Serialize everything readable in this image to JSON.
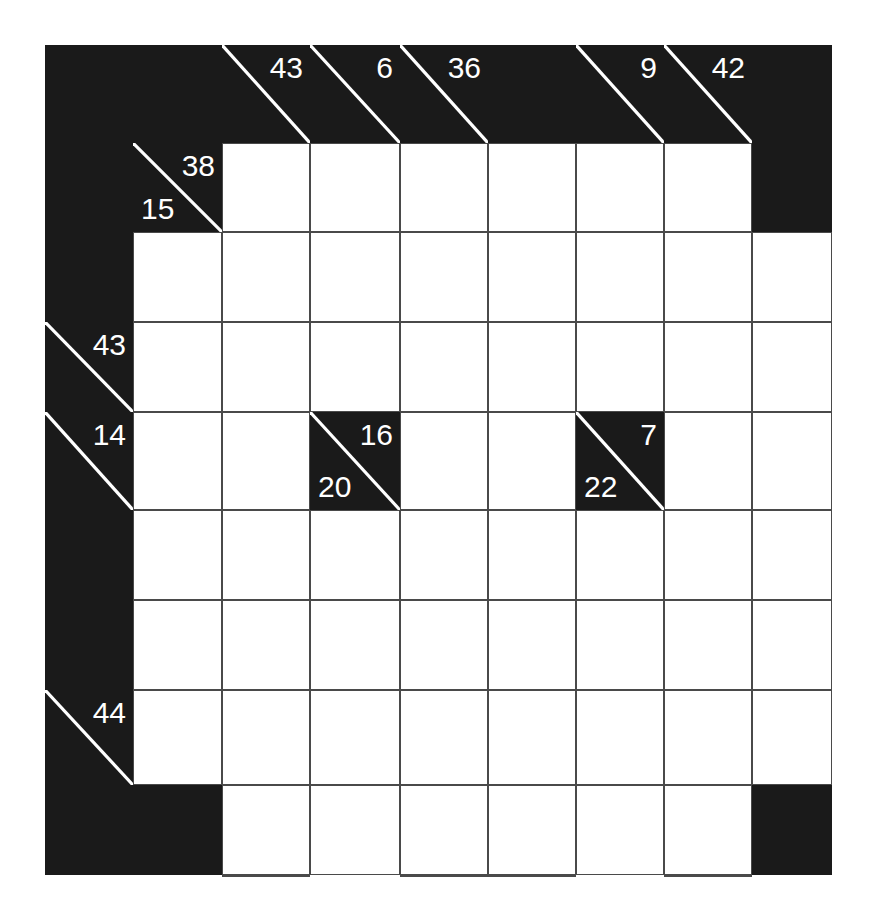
{
  "puzzle": {
    "type": "kakuro",
    "title": "Kakuro grid",
    "columns": 9,
    "rows": 9,
    "cell_width": 88,
    "cell_height": 92,
    "origin_x": 45,
    "origin_y": 45,
    "colors": {
      "block": "#1a1a1a",
      "cell": "#ffffff",
      "gridline": "#4a4a4a",
      "clue_text": "#ffffff",
      "page": "#ffffff"
    }
  },
  "cells": [
    {
      "name": "block-r0c0",
      "row": 0,
      "col": 0,
      "kind": "black"
    },
    {
      "name": "block-r0c1",
      "row": 0,
      "col": 1,
      "kind": "black"
    },
    {
      "name": "clue-r0c2",
      "row": 0,
      "col": 2,
      "kind": "clue",
      "down": "43",
      "across": ""
    },
    {
      "name": "clue-r0c3",
      "row": 0,
      "col": 3,
      "kind": "clue",
      "down": "6",
      "across": ""
    },
    {
      "name": "clue-r0c4",
      "row": 0,
      "col": 4,
      "kind": "clue",
      "down": "36",
      "across": ""
    },
    {
      "name": "block-r0c5",
      "row": 0,
      "col": 5,
      "kind": "black"
    },
    {
      "name": "clue-r0c6",
      "row": 0,
      "col": 6,
      "kind": "clue",
      "down": "9",
      "across": ""
    },
    {
      "name": "clue-r0c7",
      "row": 0,
      "col": 7,
      "kind": "clue",
      "down": "42",
      "across": ""
    },
    {
      "name": "block-r0c8",
      "row": 0,
      "col": 8,
      "kind": "black"
    },
    {
      "name": "block-r1c0",
      "row": 1,
      "col": 0,
      "kind": "black"
    },
    {
      "name": "clue-r1c1",
      "row": 1,
      "col": 1,
      "kind": "clue",
      "down": "38",
      "across": "15"
    },
    {
      "name": "cell-r1c2",
      "row": 1,
      "col": 2,
      "kind": "white"
    },
    {
      "name": "cell-r1c3",
      "row": 1,
      "col": 3,
      "kind": "white"
    },
    {
      "name": "cell-r1c4",
      "row": 1,
      "col": 4,
      "kind": "white"
    },
    {
      "name": "cell-r1c5",
      "row": 1,
      "col": 5,
      "kind": "white"
    },
    {
      "name": "cell-r1c6",
      "row": 1,
      "col": 6,
      "kind": "white"
    },
    {
      "name": "cell-r1c7",
      "row": 1,
      "col": 7,
      "kind": "white"
    },
    {
      "name": "block-r1c8",
      "row": 1,
      "col": 8,
      "kind": "black"
    },
    {
      "name": "block-r2c0",
      "row": 2,
      "col": 0,
      "kind": "black"
    },
    {
      "name": "cell-r2c1",
      "row": 2,
      "col": 1,
      "kind": "white"
    },
    {
      "name": "cell-r2c2",
      "row": 2,
      "col": 2,
      "kind": "white"
    },
    {
      "name": "cell-r2c3",
      "row": 2,
      "col": 3,
      "kind": "white"
    },
    {
      "name": "cell-r2c4",
      "row": 2,
      "col": 4,
      "kind": "white"
    },
    {
      "name": "cell-r2c5",
      "row": 2,
      "col": 5,
      "kind": "white"
    },
    {
      "name": "cell-r2c6",
      "row": 2,
      "col": 6,
      "kind": "white"
    },
    {
      "name": "cell-r2c7",
      "row": 2,
      "col": 7,
      "kind": "white"
    },
    {
      "name": "cell-r2c8",
      "row": 2,
      "col": 8,
      "kind": "white"
    },
    {
      "name": "clue-r3c0",
      "row": 3,
      "col": 0,
      "kind": "clue",
      "down": "43",
      "across": ""
    },
    {
      "name": "cell-r3c1",
      "row": 3,
      "col": 1,
      "kind": "white"
    },
    {
      "name": "cell-r3c2",
      "row": 3,
      "col": 2,
      "kind": "white"
    },
    {
      "name": "cell-r3c3",
      "row": 3,
      "col": 3,
      "kind": "white"
    },
    {
      "name": "cell-r3c4",
      "row": 3,
      "col": 4,
      "kind": "white"
    },
    {
      "name": "cell-r3c5",
      "row": 3,
      "col": 5,
      "kind": "white"
    },
    {
      "name": "cell-r3c6",
      "row": 3,
      "col": 6,
      "kind": "white"
    },
    {
      "name": "cell-r3c7",
      "row": 3,
      "col": 7,
      "kind": "white"
    },
    {
      "name": "cell-r3c8",
      "row": 3,
      "col": 8,
      "kind": "white"
    },
    {
      "name": "clue-r4c0",
      "row": 4,
      "col": 0,
      "kind": "clue",
      "down": "14",
      "across": ""
    },
    {
      "name": "cell-r4c1",
      "row": 4,
      "col": 1,
      "kind": "white"
    },
    {
      "name": "cell-r4c2",
      "row": 4,
      "col": 2,
      "kind": "white"
    },
    {
      "name": "clue-r4c3",
      "row": 4,
      "col": 3,
      "kind": "clue",
      "down": "16",
      "across": "20"
    },
    {
      "name": "cell-r4c4",
      "row": 4,
      "col": 4,
      "kind": "white"
    },
    {
      "name": "cell-r4c5",
      "row": 4,
      "col": 5,
      "kind": "white"
    },
    {
      "name": "clue-r4c6",
      "row": 4,
      "col": 6,
      "kind": "clue",
      "down": "7",
      "across": "22"
    },
    {
      "name": "cell-r4c7",
      "row": 4,
      "col": 7,
      "kind": "white"
    },
    {
      "name": "cell-r4c8",
      "row": 4,
      "col": 8,
      "kind": "white"
    },
    {
      "name": "block-r5c0",
      "row": 5,
      "col": 0,
      "kind": "black"
    },
    {
      "name": "cell-r5c1",
      "row": 5,
      "col": 1,
      "kind": "white"
    },
    {
      "name": "cell-r5c2",
      "row": 5,
      "col": 2,
      "kind": "white"
    },
    {
      "name": "cell-r5c3",
      "row": 5,
      "col": 3,
      "kind": "white"
    },
    {
      "name": "cell-r5c4",
      "row": 5,
      "col": 4,
      "kind": "white"
    },
    {
      "name": "cell-r5c5",
      "row": 5,
      "col": 5,
      "kind": "white"
    },
    {
      "name": "cell-r5c6",
      "row": 5,
      "col": 6,
      "kind": "white"
    },
    {
      "name": "cell-r5c7",
      "row": 5,
      "col": 7,
      "kind": "white"
    },
    {
      "name": "cell-r5c8",
      "row": 5,
      "col": 8,
      "kind": "white"
    },
    {
      "name": "block-r6c0",
      "row": 6,
      "col": 0,
      "kind": "black"
    },
    {
      "name": "cell-r6c1",
      "row": 6,
      "col": 1,
      "kind": "white"
    },
    {
      "name": "cell-r6c2",
      "row": 6,
      "col": 2,
      "kind": "white"
    },
    {
      "name": "cell-r6c3",
      "row": 6,
      "col": 3,
      "kind": "white"
    },
    {
      "name": "cell-r6c4",
      "row": 6,
      "col": 4,
      "kind": "white"
    },
    {
      "name": "cell-r6c5",
      "row": 6,
      "col": 5,
      "kind": "white"
    },
    {
      "name": "cell-r6c6",
      "row": 6,
      "col": 6,
      "kind": "white"
    },
    {
      "name": "cell-r6c7",
      "row": 6,
      "col": 7,
      "kind": "white"
    },
    {
      "name": "cell-r6c8",
      "row": 6,
      "col": 8,
      "kind": "white"
    },
    {
      "name": "clue-r7c0",
      "row": 7,
      "col": 0,
      "kind": "clue",
      "down": "44",
      "across": ""
    },
    {
      "name": "cell-r7c1",
      "row": 7,
      "col": 1,
      "kind": "white"
    },
    {
      "name": "cell-r7c2",
      "row": 7,
      "col": 2,
      "kind": "white"
    },
    {
      "name": "cell-r7c3",
      "row": 7,
      "col": 3,
      "kind": "white"
    },
    {
      "name": "cell-r7c4",
      "row": 7,
      "col": 4,
      "kind": "white"
    },
    {
      "name": "cell-r7c5",
      "row": 7,
      "col": 5,
      "kind": "white"
    },
    {
      "name": "cell-r7c6",
      "row": 7,
      "col": 6,
      "kind": "white"
    },
    {
      "name": "cell-r7c7",
      "row": 7,
      "col": 7,
      "kind": "white"
    },
    {
      "name": "cell-r7c8",
      "row": 7,
      "col": 8,
      "kind": "white"
    },
    {
      "name": "block-r8c0",
      "row": 8,
      "col": 0,
      "kind": "black"
    },
    {
      "name": "block-r8c1",
      "row": 8,
      "col": 1,
      "kind": "black"
    },
    {
      "name": "cell-r8c2",
      "row": 8,
      "col": 2,
      "kind": "white"
    },
    {
      "name": "cell-r8c3",
      "row": 8,
      "col": 3,
      "kind": "white"
    },
    {
      "name": "cell-r8c4",
      "row": 8,
      "col": 4,
      "kind": "white"
    },
    {
      "name": "cell-r8c5",
      "row": 8,
      "col": 5,
      "kind": "white"
    },
    {
      "name": "cell-r8c6",
      "row": 8,
      "col": 6,
      "kind": "white"
    },
    {
      "name": "cell-r8c7",
      "row": 8,
      "col": 7,
      "kind": "white"
    },
    {
      "name": "block-r8c8",
      "row": 8,
      "col": 8,
      "kind": "black"
    },
    {
      "name": "block-r9c0",
      "row": 9,
      "col": 0,
      "kind": "black"
    },
    {
      "name": "block-r9c1",
      "row": 9,
      "col": 1,
      "kind": "black"
    },
    {
      "name": "cell-r9c2",
      "row": 9,
      "col": 2,
      "kind": "white"
    },
    {
      "name": "clue-r9c3",
      "row": 9,
      "col": 3,
      "kind": "clue",
      "down": "15",
      "across": ""
    },
    {
      "name": "cell-r9c4",
      "row": 9,
      "col": 4,
      "kind": "white"
    },
    {
      "name": "cell-r9c5",
      "row": 9,
      "col": 5,
      "kind": "white"
    },
    {
      "name": "block-r9c6",
      "row": 9,
      "col": 6,
      "kind": "black"
    },
    {
      "name": "cell-r9c7",
      "row": 9,
      "col": 7,
      "kind": "white"
    },
    {
      "name": "block-r9c8",
      "row": 9,
      "col": 8,
      "kind": "black"
    }
  ],
  "clue_list": {
    "down": [
      "43",
      "6",
      "36",
      "9",
      "42",
      "38",
      "16",
      "7",
      "15"
    ],
    "across": [
      "15",
      "43",
      "14",
      "44",
      "20",
      "22"
    ]
  }
}
